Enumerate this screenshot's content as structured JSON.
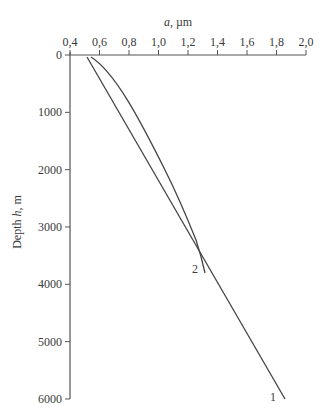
{
  "chart_data": {
    "type": "line",
    "title": "",
    "xlabel": "a, µm",
    "ylabel": "Depth h, m",
    "xlim": [
      0.4,
      2.0
    ],
    "ylim": [
      6000,
      0
    ],
    "x_axis_position": "top",
    "y_inverted": true,
    "xticks": [
      "0,4",
      "0,6",
      "0,8",
      "1,0",
      "1,2",
      "1,4",
      "1,6",
      "1,8",
      "2,0"
    ],
    "yticks": [
      "0",
      "1000",
      "2000",
      "3000",
      "4000",
      "5000",
      "6000"
    ],
    "grid": false,
    "series": [
      {
        "name": "1",
        "points": [
          [
            0.52,
            30
          ],
          [
            0.72,
            1000
          ],
          [
            0.89,
            2000
          ],
          [
            1.05,
            3000
          ],
          [
            1.22,
            4000
          ],
          [
            1.38,
            5000
          ],
          [
            1.86,
            6000
          ]
        ]
      },
      {
        "name": "2",
        "points": [
          [
            0.54,
            30
          ],
          [
            0.83,
            1000
          ],
          [
            1.07,
            2000
          ],
          [
            1.22,
            3000
          ],
          [
            1.31,
            3800
          ]
        ]
      }
    ],
    "annotations": [
      {
        "text": "1",
        "at": [
          1.75,
          6000
        ]
      },
      {
        "text": "2",
        "at": [
          1.24,
          3700
        ]
      }
    ]
  },
  "labels": {
    "xlabel_italic": "a",
    "xlabel_rest": ", µm",
    "ylabel_pre": "Depth ",
    "ylabel_italic": "h",
    "ylabel_rest": ", m",
    "curve1": "1",
    "curve2": "2"
  },
  "xticks": [
    "0,4",
    "0,6",
    "0,8",
    "1,0",
    "1,2",
    "1,4",
    "1,6",
    "1,8",
    "2,0"
  ],
  "yticks": [
    "0",
    "1000",
    "2000",
    "3000",
    "4000",
    "5000",
    "6000"
  ]
}
